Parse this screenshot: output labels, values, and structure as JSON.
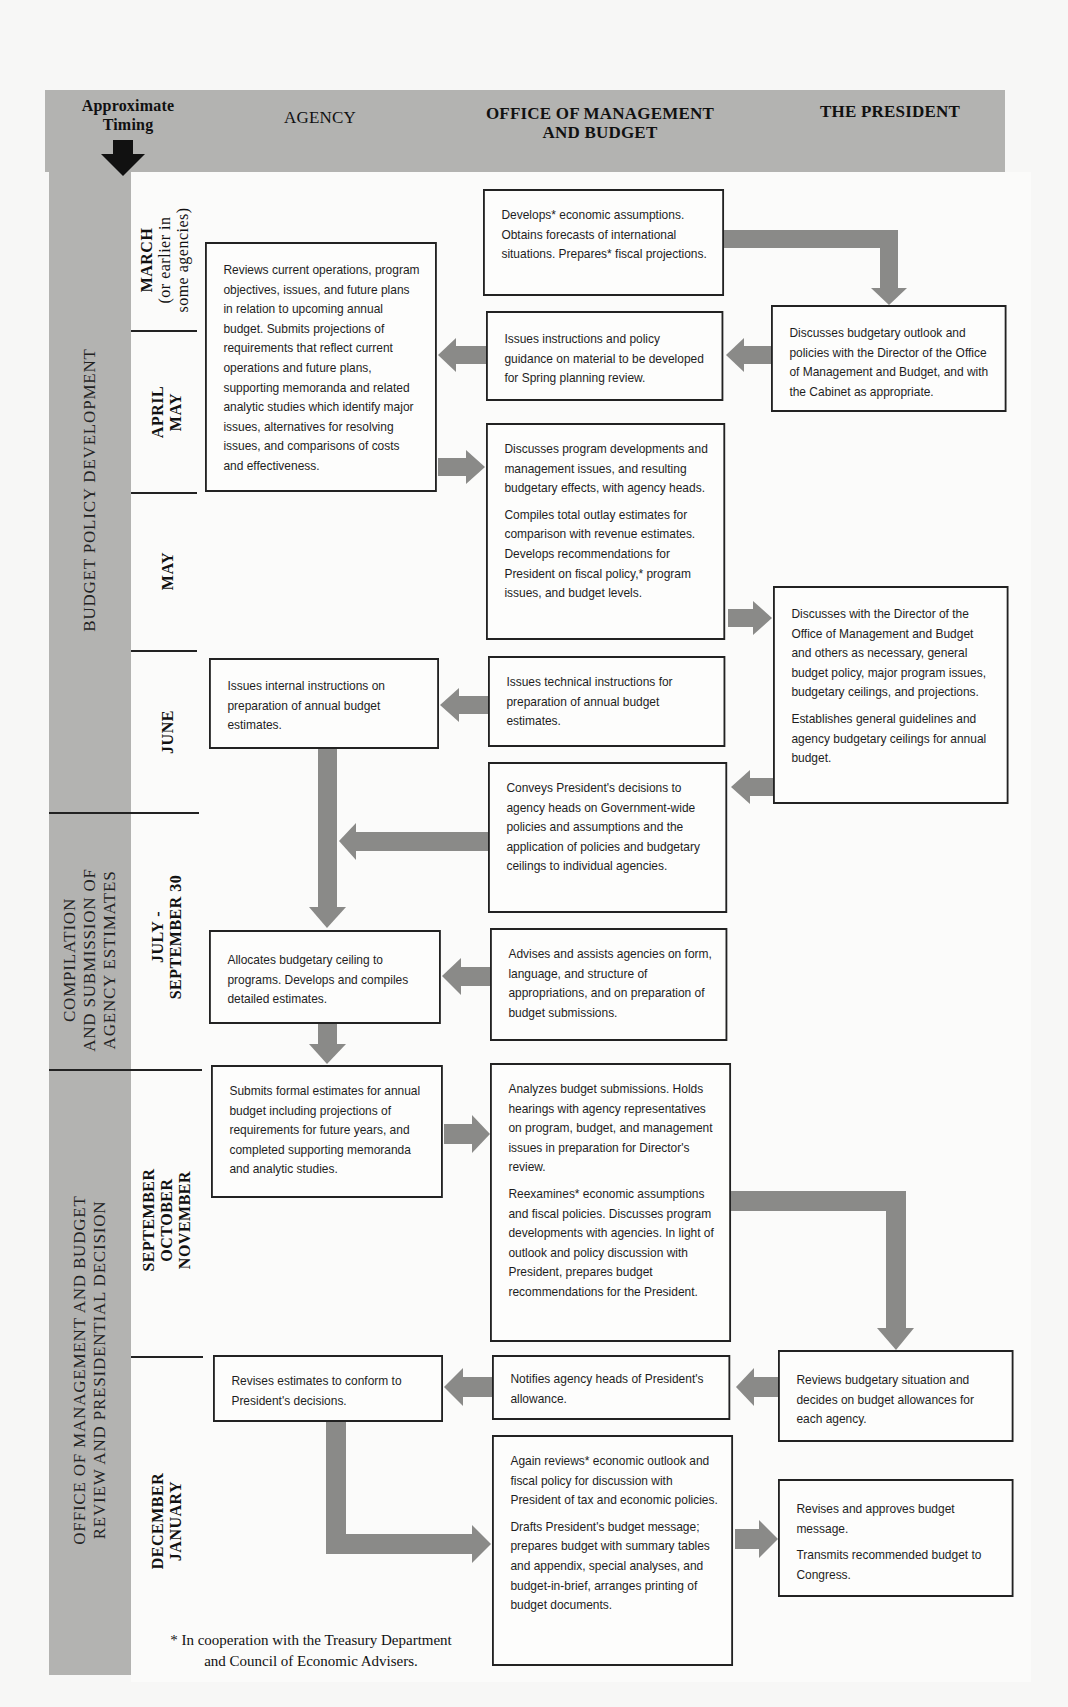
{
  "header": {
    "timing_label_line1": "Approximate",
    "timing_label_line2": "Timing",
    "col_agency": "AGENCY",
    "col_omb_line1": "OFFICE OF MANAGEMENT",
    "col_omb_line2": "AND BUDGET",
    "col_president": "THE PRESIDENT"
  },
  "phases": [
    {
      "label": "BUDGET POLICY DEVELOPMENT"
    },
    {
      "label_line1": "COMPILATION",
      "label_line2": "AND SUBMISSION OF",
      "label_line3": "AGENCY ESTIMATES"
    },
    {
      "label_line1": "OFFICE OF MANAGEMENT AND BUDGET",
      "label_line2": "REVIEW AND PRESIDENTIAL DECISION"
    }
  ],
  "timing": [
    {
      "line1": "MARCH",
      "line2": "(or earlier in",
      "line3": "some agencies)"
    },
    {
      "line1": "APRIL",
      "line2": "MAY"
    },
    {
      "line1": "MAY"
    },
    {
      "line1": "JUNE"
    },
    {
      "line1": "JULY -",
      "line2": "SEPTEMBER 30"
    },
    {
      "line1": "SEPTEMBER",
      "line2": "OCTOBER",
      "line3": "NOVEMBER"
    },
    {
      "line1": "DECEMBER",
      "line2": "JANUARY"
    }
  ],
  "agency": [
    {
      "p1": "Reviews current operations, program objectives, issues, and future plans in relation to upcoming annual budget. Submits projections of requirements that reflect current operations and future plans, supporting memoranda and related analytic studies which identify major issues, alternatives for resolving issues, and comparisons of costs and effectiveness."
    },
    {
      "p1": "Issues internal instructions on preparation of annual budget estimates."
    },
    {
      "p1": "Allocates budgetary ceiling to programs. Develops and compiles detailed estimates."
    },
    {
      "p1": "Submits formal estimates for annual budget including projections of requirements for future years, and completed supporting memoranda and analytic studies."
    },
    {
      "p1": "Revises estimates to conform to President's decisions."
    }
  ],
  "omb": [
    {
      "p1": "Develops* economic assumptions. Obtains forecasts of international situations. Prepares* fiscal projections."
    },
    {
      "p1": "Issues instructions and policy guidance on material to be developed for Spring planning review."
    },
    {
      "p1": "Discusses program developments and management issues, and resulting budgetary effects, with agency heads.",
      "p2": "Compiles total outlay estimates for comparison with revenue estimates. Develops recommendations for President on fiscal policy,* program issues, and budget levels."
    },
    {
      "p1": "Issues technical instructions for preparation of annual budget estimates."
    },
    {
      "p1": "Conveys President's decisions to agency heads on Government-wide policies and assumptions and the application of policies and budgetary ceilings to individual agencies."
    },
    {
      "p1": "Advises and assists agencies on form, language, and structure of appropriations, and on preparation of budget submissions."
    },
    {
      "p1": "Analyzes budget submissions. Holds hearings with agency representatives on program, budget, and management issues in preparation for Director's review.",
      "p2": "Reexamines* economic assumptions and fiscal policies. Discusses program developments with agencies. In light of outlook and policy discussion with President, prepares budget recommendations for the President."
    },
    {
      "p1": "Notifies agency heads of President's allowance."
    },
    {
      "p1": "Again reviews* economic outlook and fiscal policy for discussion with President of tax and economic policies.",
      "p2": "Drafts President's budget message; prepares budget with summary tables and appendix, special analyses, and budget-in-brief, arranges printing of budget documents."
    }
  ],
  "president": [
    {
      "p1": "Discusses budgetary outlook and policies with the Director of the Office of Management and Budget, and with the Cabinet as appropriate."
    },
    {
      "p1": "Discusses with the Director of the Office of Management and Budget and others as necessary, general budget policy, major program issues, budgetary ceilings, and projections.",
      "p2": "Establishes general guidelines and agency budgetary ceilings for annual budget."
    },
    {
      "p1": "Reviews budgetary situation and decides on budget allowances for each agency."
    },
    {
      "p1": "Revises and approves budget message.",
      "p2": "Transmits recommended budget to Congress."
    }
  ],
  "footnote": {
    "line1": "* In cooperation with the Treasury Department",
    "line2": "and Council of Economic Advisers."
  },
  "colors": {
    "band": "#b3b3b1",
    "arrow": "#8a8a88",
    "border": "#222222"
  }
}
